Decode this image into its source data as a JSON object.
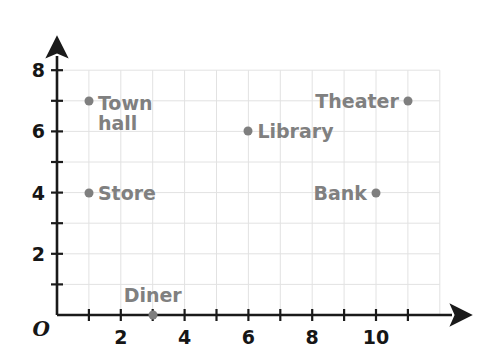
{
  "chart_data": {
    "type": "scatter",
    "title": "",
    "xlabel": "",
    "ylabel": "",
    "xlim": [
      0,
      12
    ],
    "ylim": [
      0,
      8.4
    ],
    "grid": true,
    "legend": "none",
    "origin_label": "O",
    "x_ticks": [
      {
        "value": 1,
        "label": ""
      },
      {
        "value": 2,
        "label": "2"
      },
      {
        "value": 3,
        "label": ""
      },
      {
        "value": 4,
        "label": "4"
      },
      {
        "value": 5,
        "label": ""
      },
      {
        "value": 6,
        "label": "6"
      },
      {
        "value": 7,
        "label": ""
      },
      {
        "value": 8,
        "label": "8"
      },
      {
        "value": 9,
        "label": ""
      },
      {
        "value": 10,
        "label": "10"
      },
      {
        "value": 11,
        "label": ""
      }
    ],
    "y_ticks": [
      {
        "value": 1,
        "label": ""
      },
      {
        "value": 2,
        "label": "2"
      },
      {
        "value": 3,
        "label": ""
      },
      {
        "value": 4,
        "label": "4"
      },
      {
        "value": 5,
        "label": ""
      },
      {
        "value": 6,
        "label": "6"
      },
      {
        "value": 7,
        "label": ""
      },
      {
        "value": 8,
        "label": "8"
      }
    ],
    "points": [
      {
        "name": "Town hall",
        "label": "Town\nhall",
        "x": 1,
        "y": 7,
        "label_pos": "right"
      },
      {
        "name": "Store",
        "label": "Store",
        "x": 1,
        "y": 4,
        "label_pos": "right"
      },
      {
        "name": "Library",
        "label": "Library",
        "x": 6,
        "y": 6,
        "label_pos": "right"
      },
      {
        "name": "Theater",
        "label": "Theater",
        "x": 11,
        "y": 7,
        "label_pos": "left"
      },
      {
        "name": "Bank",
        "label": "Bank",
        "x": 10,
        "y": 4,
        "label_pos": "left"
      },
      {
        "name": "Diner",
        "label": "Diner",
        "x": 3,
        "y": 0,
        "label_pos": "above"
      }
    ]
  },
  "colors": {
    "axis": "#1a1a1a",
    "grid": "#e2e2e2",
    "point": "#7f7f7f",
    "point_label": "#808080",
    "tick_label": "#161616",
    "background": "#ffffff"
  }
}
